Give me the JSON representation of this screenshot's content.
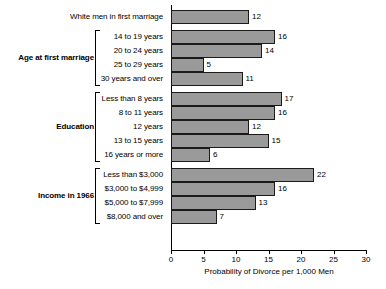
{
  "chart_data": {
    "type": "bar",
    "orientation": "horizontal",
    "title": "",
    "xlabel": "Probability of Divorce per 1,000 Men",
    "ylabel": "",
    "xlim": [
      0,
      30
    ],
    "xticks": [
      0,
      5,
      10,
      15,
      20,
      25,
      30
    ],
    "grid": false,
    "legend": null,
    "bar_color": "#9a9a9a",
    "bar_edge_color": "#1a1a1a",
    "background": "#ffffff",
    "groups": [
      {
        "name": "",
        "bracket": false,
        "categories": [
          "White men in first marriage"
        ],
        "values": [
          12
        ]
      },
      {
        "name": "Age at first marriage",
        "bracket": true,
        "categories": [
          "14 to 19 years",
          "20 to 24 years",
          "25 to 29 years",
          "30 years and over"
        ],
        "values": [
          16,
          14,
          5,
          11
        ]
      },
      {
        "name": "Education",
        "bracket": true,
        "categories": [
          "Less than 8 years",
          "8 to 11 years",
          "12 years",
          "13 to 15 years",
          "16 years or more"
        ],
        "values": [
          17,
          16,
          12,
          15,
          6
        ]
      },
      {
        "name": "Income in 1966",
        "bracket": true,
        "categories": [
          "Less than $3,000",
          "$3,000 to $4,999",
          "$5,000 to $7,999",
          "$8,000 and over"
        ],
        "values": [
          22,
          16,
          13,
          7
        ]
      }
    ],
    "categories": [
      "White men in first marriage",
      "14 to 19 years",
      "20 to 24 years",
      "25 to 29 years",
      "30 years and over",
      "Less than 8 years",
      "8 to 11 years",
      "12 years",
      "13 to 15 years",
      "16 years or more",
      "Less than $3,000",
      "$3,000 to $4,999",
      "$5,000 to $7,999",
      "$8,000 and over"
    ],
    "values": [
      12,
      16,
      14,
      5,
      11,
      17,
      16,
      12,
      15,
      6,
      22,
      16,
      13,
      7
    ]
  }
}
